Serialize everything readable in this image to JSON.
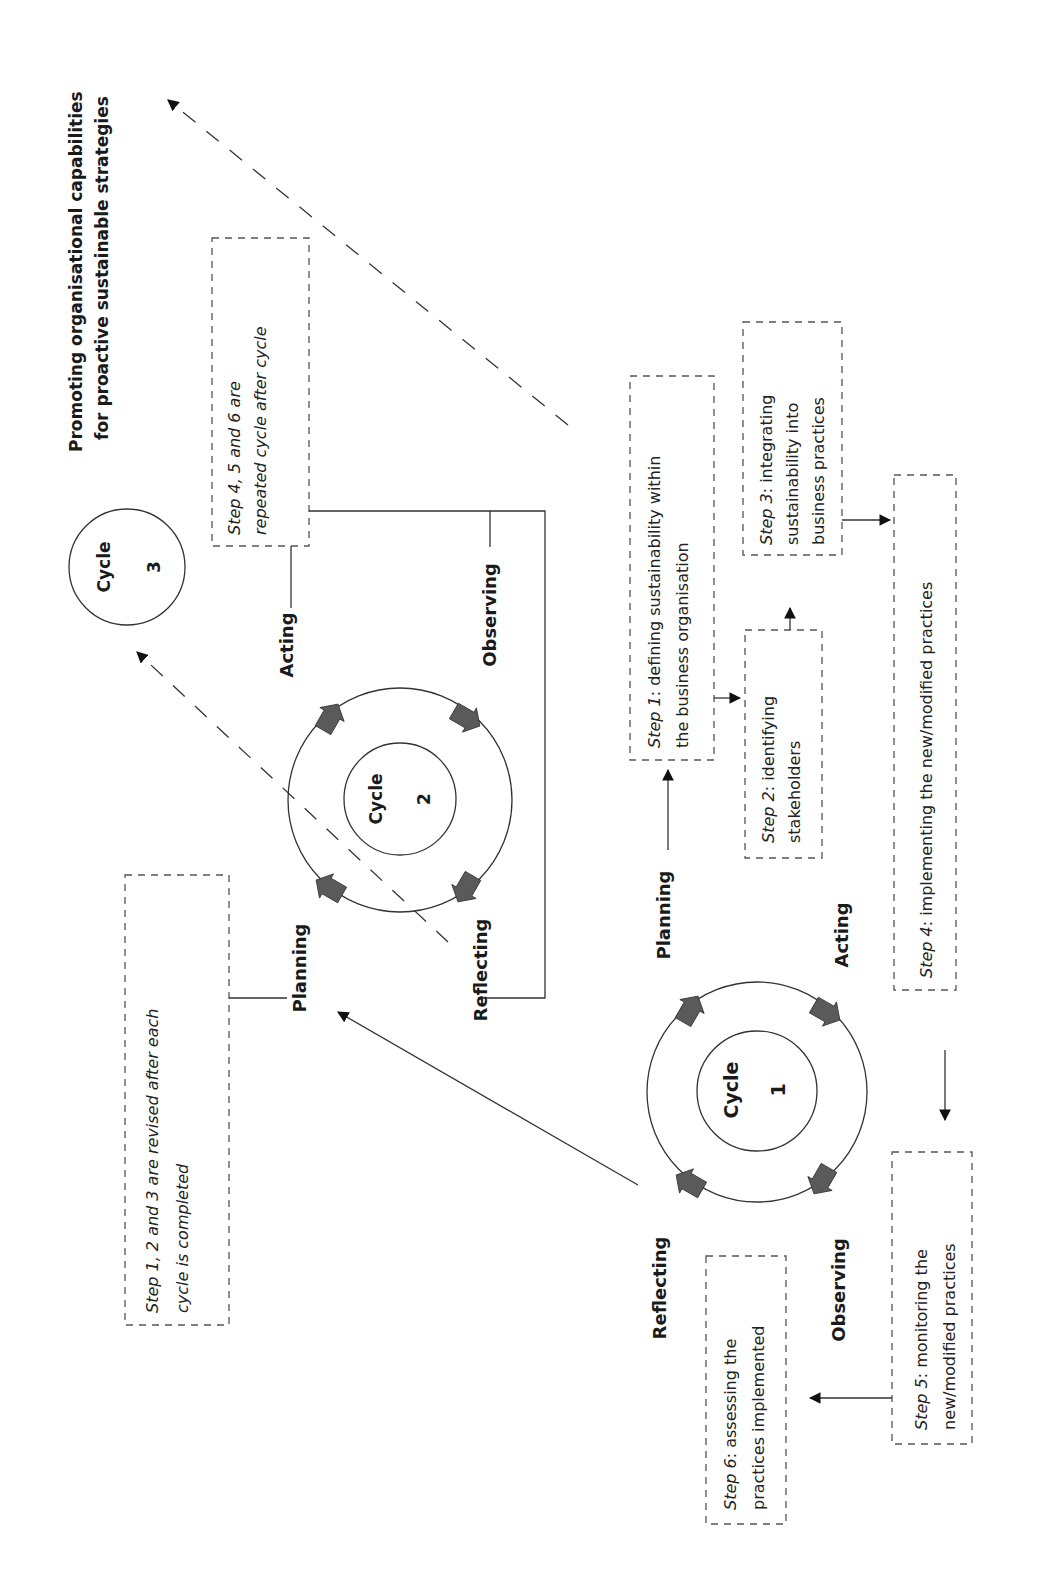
{
  "goal": {
    "line1": "Promoting organisational capabilities",
    "line2": "for proactive sustainable strategies"
  },
  "cycles": [
    {
      "id": 1,
      "label": "Cycle",
      "number": "1",
      "phases": {
        "planning": "Planning",
        "acting": "Acting",
        "observing": "Observing",
        "reflecting": "Reflecting"
      }
    },
    {
      "id": 2,
      "label": "Cycle",
      "number": "2",
      "phases": {
        "planning": "Planning",
        "acting": "Acting",
        "observing": "Observing",
        "reflecting": "Reflecting"
      }
    },
    {
      "id": 3,
      "label": "Cycle",
      "number": "3"
    }
  ],
  "steps": [
    {
      "id": 1,
      "prefix": "Step 1",
      "line1_rest": ": defining sustainability within",
      "line2": "the business organisation"
    },
    {
      "id": 2,
      "prefix": "Step 2",
      "line1_rest": ": identifying",
      "line2": "stakeholders"
    },
    {
      "id": 3,
      "prefix": "Step 3",
      "line1_rest": ": integrating",
      "line2": "sustainability into",
      "line3": "business practices"
    },
    {
      "id": 4,
      "prefix": "Step 4",
      "line1_rest": ": implementing the new/modified practices"
    },
    {
      "id": 5,
      "prefix": "Step 5",
      "line1_rest": ": monitoring the",
      "line2": "new/modified practices"
    },
    {
      "id": 6,
      "prefix": "Step 6",
      "line1_rest": ": assessing the",
      "line2": "practices implemented"
    }
  ],
  "notes": {
    "revision": {
      "line1": "Step 1, 2 and 3 are revised after each",
      "line2": "cycle is completed"
    },
    "repetition": {
      "line1": "Step 4, 5 and 6 are",
      "line2": "repeated cycle after cycle"
    }
  },
  "colors": {
    "arrow_fill": "#5a5a5a",
    "line": "#333333",
    "background": "#ffffff"
  }
}
